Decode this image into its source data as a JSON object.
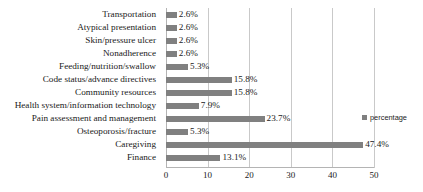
{
  "chart_data": {
    "type": "bar",
    "orientation": "horizontal",
    "title": "",
    "xlabel": "",
    "ylabel": "",
    "xlim": [
      0,
      50
    ],
    "xticks": [
      0,
      10,
      20,
      30,
      40,
      50
    ],
    "xtick_labels": [
      "0",
      "10",
      "20",
      "30",
      "40",
      "50"
    ],
    "grid": true,
    "grid_axis": "x",
    "legend": {
      "position": "right",
      "entries": [
        {
          "name": "percentage",
          "color": "#808080"
        }
      ]
    },
    "bar_color": "#808080",
    "categories": [
      "Transportation",
      "Atypical presentation",
      "Skin/pressure ulcer",
      "Nonadherence",
      "Feeding/nutrition/swallow",
      "Code status/advance directives",
      "Community resources",
      "Health system/information technology",
      "Pain assessment and management",
      "Osteoporosis/fracture",
      "Caregiving",
      "Finance"
    ],
    "values": [
      2.6,
      2.6,
      2.6,
      2.6,
      5.3,
      15.8,
      15.8,
      7.9,
      23.7,
      5.3,
      47.4,
      13.1
    ],
    "value_labels": [
      "2.6%",
      "2.6%",
      "2.6%",
      "2.6%",
      "5.3%",
      "15.8%",
      "15.8%",
      "7.9%",
      "23.7%",
      "5.3%",
      "47.4%",
      "13.1%"
    ],
    "series": [
      {
        "name": "percentage",
        "values": [
          2.6,
          2.6,
          2.6,
          2.6,
          5.3,
          15.8,
          15.8,
          7.9,
          23.7,
          5.3,
          47.4,
          13.1
        ]
      }
    ]
  }
}
